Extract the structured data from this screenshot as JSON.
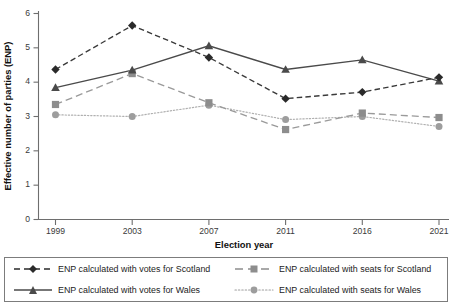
{
  "chart_data": {
    "type": "line",
    "title": "",
    "xlabel": "Election year",
    "ylabel": "Effective number of parties (ENP)",
    "categories": [
      "1999",
      "2003",
      "2007",
      "2011",
      "2016",
      "2021"
    ],
    "x": [
      1999,
      2003,
      2007,
      2011,
      2016,
      2021
    ],
    "ylim": [
      0,
      6
    ],
    "yticks": [
      "0",
      "1",
      "2",
      "3",
      "4",
      "5",
      "6"
    ],
    "ytick_values": [
      0,
      1,
      2,
      3,
      4,
      5,
      6
    ],
    "xticks": [
      "1999",
      "2003",
      "2007",
      "2011",
      "2016",
      "2021"
    ],
    "grid": false,
    "legend_position": "bottom",
    "series": [
      {
        "name": "ENP calculated with votes for Scotland",
        "key": "votes_scotland",
        "values": [
          4.37,
          5.65,
          4.72,
          3.52,
          3.71,
          4.14
        ],
        "color": "#2a2a2a",
        "linestyle": "dashed",
        "marker": "diamond"
      },
      {
        "name": "ENP calculated with votes for Wales",
        "key": "votes_wales",
        "values": [
          3.84,
          4.35,
          5.06,
          4.37,
          4.65,
          4.03
        ],
        "color": "#4a4a4a",
        "linestyle": "solid",
        "marker": "triangle"
      },
      {
        "name": "ENP calculated with seats for Scotland",
        "key": "seats_scotland",
        "values": [
          3.35,
          4.25,
          3.4,
          2.62,
          3.1,
          2.97
        ],
        "color": "#8d8d8d",
        "linestyle": "long-dashed",
        "marker": "square"
      },
      {
        "name": "ENP calculated with seats for Wales",
        "key": "seats_wales",
        "values": [
          3.05,
          3.0,
          3.33,
          2.91,
          3.0,
          2.71
        ],
        "color": "#9d9d9d",
        "linestyle": "dotted",
        "marker": "circle"
      }
    ]
  },
  "axes": {
    "y_title": "Effective number of parties (ENP)",
    "x_title": "Election year"
  },
  "legend": {
    "items": [
      {
        "label": "ENP calculated with votes for Scotland"
      },
      {
        "label": "ENP calculated with seats for Scotland"
      },
      {
        "label": "ENP calculated with votes for Wales"
      },
      {
        "label": "ENP calculated with seats for Wales"
      }
    ]
  }
}
